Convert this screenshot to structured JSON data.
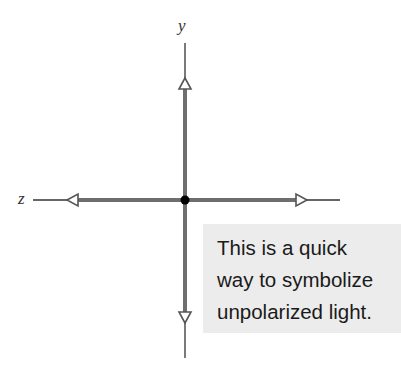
{
  "diagram": {
    "axes": {
      "y_label": "y",
      "z_label": "z"
    },
    "note": {
      "lines": [
        "This is a quick",
        "way to symbolize",
        "unpolarized light."
      ]
    },
    "colors": {
      "thick_line": "#6e6e6e",
      "thin_line": "#333333",
      "origin_dot": "#000000",
      "note_background": "#ececec"
    }
  }
}
